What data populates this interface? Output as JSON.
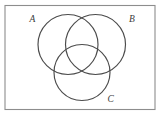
{
  "figure": {
    "kind": "venn-diagram",
    "frame": {
      "stroke_color": "#8d8d8d",
      "x": 5,
      "y": 5.5,
      "width": 150,
      "height": 104
    },
    "background_color": "#ffffff",
    "circle_stroke_color": "#4b4b4b"
  },
  "labels": {
    "a": "A",
    "b": "B",
    "c": "C"
  },
  "chart_data": {
    "type": "venn",
    "title": "",
    "sets": [
      "A",
      "B",
      "C"
    ],
    "circles": [
      {
        "label": "A",
        "cx": 68,
        "cy": 44.5,
        "r": 30
      },
      {
        "label": "B",
        "cx": 95.5,
        "cy": 44.5,
        "r": 30
      },
      {
        "label": "C",
        "cx": 82,
        "cy": 72.5,
        "r": 28
      }
    ],
    "label_positions": [
      {
        "label": "A",
        "x": 29.5,
        "y": 21.5
      },
      {
        "label": "B",
        "x": 129,
        "y": 21.5
      },
      {
        "label": "C",
        "x": 107.5,
        "y": 101.5
      }
    ],
    "regions": [
      "A",
      "B",
      "C",
      "A∩B",
      "A∩C",
      "B∩C",
      "A∩B∩C"
    ],
    "shaded_regions": [],
    "legend": null,
    "xlabel": "",
    "ylabel": ""
  }
}
